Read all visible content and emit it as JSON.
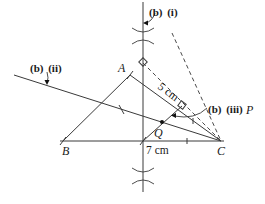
{
  "diagram": {
    "colors": {
      "line": "#3a3a3a",
      "text": "#1a1a1a",
      "background": "#ffffff"
    },
    "points": {
      "A": {
        "label": "A",
        "x": 130,
        "y": 75
      },
      "B": {
        "label": "B",
        "x": 63,
        "y": 141
      },
      "C": {
        "label": "C",
        "x": 221,
        "y": 141
      },
      "Q": {
        "label": "Q",
        "x": 162,
        "y": 122
      },
      "P": {
        "label": "P"
      }
    },
    "measurements": {
      "AC": "5 cm",
      "BC": "7 cm"
    },
    "annotations": {
      "b_i": {
        "part": "(b)",
        "sub": "(i)"
      },
      "b_ii": {
        "part": "(b)",
        "sub": "(ii)"
      },
      "b_iii": {
        "part": "(b)",
        "sub": "(iii)",
        "point": "P"
      }
    }
  }
}
